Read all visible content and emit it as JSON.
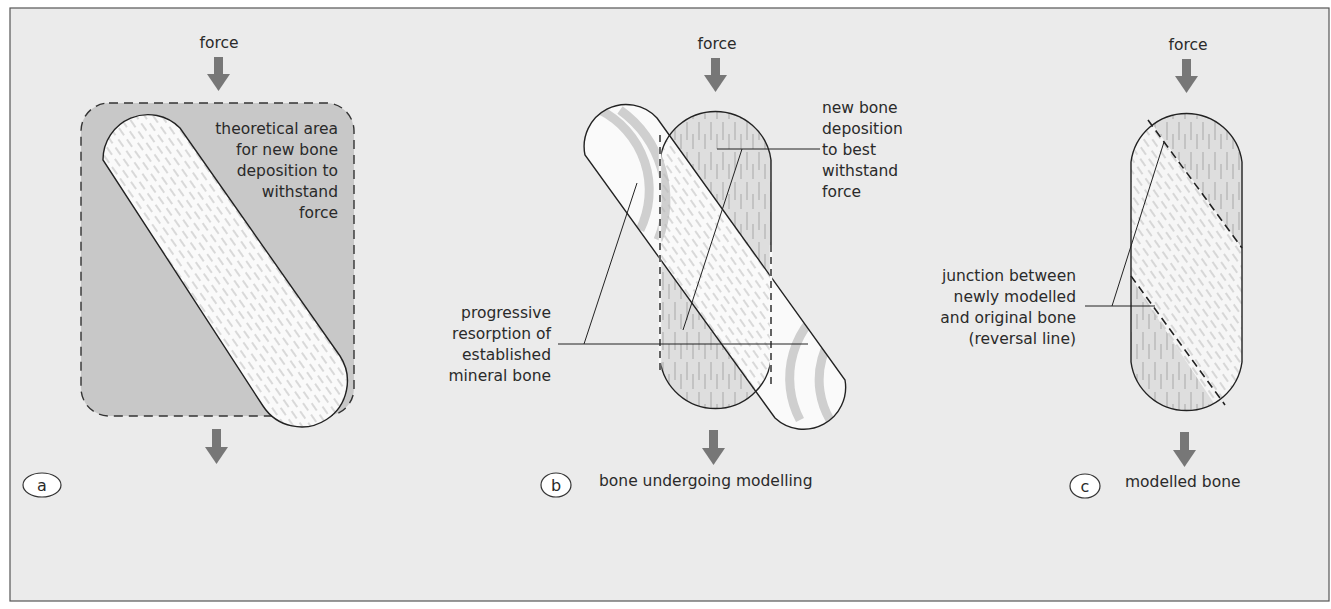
{
  "figure": {
    "background": "#ebebeb",
    "border_color": "#555555",
    "arrow_color": "#777777",
    "shade_color": "#c8c8c8",
    "bone_fill": "#fafafa",
    "lamella_color": "#b4b4b4",
    "panels": [
      {
        "id": "a",
        "label": "a",
        "force_label": "force",
        "annotation_lines": [
          "theoretical area",
          "for new bone",
          "deposition to",
          "withstand",
          "force"
        ],
        "caption": ""
      },
      {
        "id": "b",
        "label": "b",
        "force_label": "force",
        "deposition_lines": [
          "new bone",
          "deposition",
          "to best",
          "withstand",
          "force"
        ],
        "resorption_lines": [
          "progressive",
          "resorption of",
          "established",
          "mineral bone"
        ],
        "caption": "bone undergoing modelling"
      },
      {
        "id": "c",
        "label": "c",
        "force_label": "force",
        "junction_lines": [
          "junction between",
          "newly modelled",
          "and original bone",
          "(reversal line)"
        ],
        "caption": "modelled bone"
      }
    ]
  }
}
